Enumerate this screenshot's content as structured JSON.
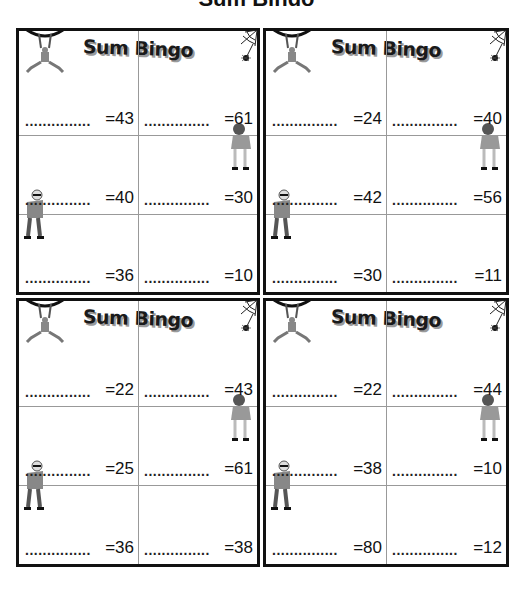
{
  "page": {
    "title_fragment": "Sum Bingo"
  },
  "cards": [
    {
      "title": "Sum Bingo",
      "cells": [
        {
          "dots": "...............",
          "target": "=43"
        },
        {
          "dots": "...............",
          "target": "=61"
        },
        {
          "dots": "...............",
          "target": "=40"
        },
        {
          "dots": "...............",
          "target": "=30"
        },
        {
          "dots": "...............",
          "target": "=36"
        },
        {
          "dots": "...............",
          "target": "=10"
        }
      ]
    },
    {
      "title": "Sum Bingo",
      "cells": [
        {
          "dots": "...............",
          "target": "=24"
        },
        {
          "dots": "...............",
          "target": "=40"
        },
        {
          "dots": "...............",
          "target": "=42"
        },
        {
          "dots": "...............",
          "target": "=56"
        },
        {
          "dots": "...............",
          "target": "=30"
        },
        {
          "dots": "...............",
          "target": "=11"
        }
      ]
    },
    {
      "title": "Sum Bingo",
      "cells": [
        {
          "dots": "...............",
          "target": "=22"
        },
        {
          "dots": "...............",
          "target": "=43"
        },
        {
          "dots": "...............",
          "target": "=25"
        },
        {
          "dots": "...............",
          "target": "=61"
        },
        {
          "dots": "...............",
          "target": "=36"
        },
        {
          "dots": "...............",
          "target": "=38"
        }
      ]
    },
    {
      "title": "Sum Bingo",
      "cells": [
        {
          "dots": "...............",
          "target": "=22"
        },
        {
          "dots": "...............",
          "target": "=44"
        },
        {
          "dots": "...............",
          "target": "=38"
        },
        {
          "dots": "...............",
          "target": "=10"
        },
        {
          "dots": "...............",
          "target": "=80"
        },
        {
          "dots": "...............",
          "target": "=12"
        }
      ]
    }
  ],
  "colors": {
    "border": "#111111",
    "grid": "#999999",
    "shadow": "#9a9a9a"
  }
}
